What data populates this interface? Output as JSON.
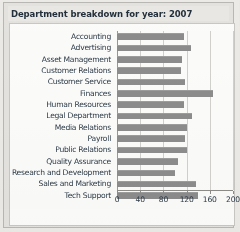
{
  "window": {
    "title": "Department breakdown for year: 2007"
  },
  "chart_data": {
    "type": "bar",
    "orientation": "horizontal",
    "title": "Department breakdown for year: 2007",
    "xlabel": "",
    "ylabel": "",
    "xlim": [
      0,
      200
    ],
    "grid": true,
    "legend": "none",
    "bar_color": "#8c8c8c",
    "xticks": [
      0,
      40,
      80,
      120,
      160,
      200
    ],
    "categories": [
      "Accounting",
      "Advertising",
      "Asset Management",
      "Customer Relations",
      "Customer Service",
      "Finances",
      "Human Resources",
      "Legal Department",
      "Media Relations",
      "Payroll",
      "Public Relations",
      "Quality Assurance",
      "Research and Development",
      "Sales and Marketing",
      "Tech Support"
    ],
    "values": [
      115,
      128,
      112,
      110,
      118,
      165,
      115,
      130,
      120,
      118,
      120,
      105,
      100,
      137,
      140
    ]
  }
}
